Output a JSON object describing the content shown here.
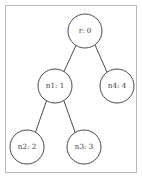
{
  "diagram": {
    "type": "tree",
    "frame": {
      "x": 5.5,
      "y": 5.5,
      "width": 131,
      "height": 167,
      "stroke_color": "#b9b9b9",
      "fill_color": "#ffffff"
    },
    "style": {
      "node_stroke_color": "#4a4a4a",
      "node_fill_color": "#ffffff",
      "edge_color": "#4a4a4a",
      "label_color": "#3a3a3a",
      "node_radius": 17
    },
    "nodes": [
      {
        "id": "r",
        "label": "r: 0",
        "name": "r",
        "value": 0,
        "cx": 85,
        "cy": 31,
        "r": 17
      },
      {
        "id": "n1",
        "label": "n1: 1",
        "name": "n1",
        "value": 1,
        "cx": 55,
        "cy": 86,
        "r": 17
      },
      {
        "id": "n4",
        "label": "n4: 4",
        "name": "n4",
        "value": 4,
        "cx": 117,
        "cy": 86,
        "r": 17
      },
      {
        "id": "n2",
        "label": "n2: 2",
        "name": "n2",
        "value": 2,
        "cx": 27,
        "cy": 147,
        "r": 17
      },
      {
        "id": "n3",
        "label": "n3: 3",
        "name": "n3",
        "value": 3,
        "cx": 84,
        "cy": 147,
        "r": 17
      }
    ],
    "edges": [
      {
        "id": "r-n1",
        "from": "r",
        "to": "n1",
        "x1": 76.0,
        "y1": 45.4,
        "x2": 63.9,
        "y2": 71.6
      },
      {
        "id": "r-n4",
        "from": "r",
        "to": "n4",
        "x1": 95.1,
        "y1": 45.1,
        "x2": 106.9,
        "y2": 71.9
      },
      {
        "id": "n1-n2",
        "from": "n1",
        "to": "n2",
        "x1": 46.5,
        "y1": 100.7,
        "x2": 35.5,
        "y2": 132.3
      },
      {
        "id": "n1-n3",
        "from": "n1",
        "to": "n3",
        "x1": 63.9,
        "y1": 100.8,
        "x2": 75.1,
        "y2": 132.2
      }
    ]
  }
}
